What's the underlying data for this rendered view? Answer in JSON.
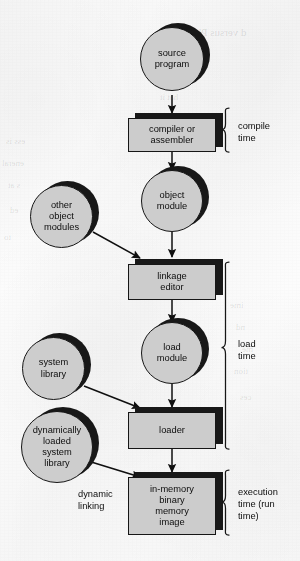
{
  "figure": {
    "ink_color": "#111111",
    "node_fill": "#c9c9c9",
    "node_shadow": "#1c1c1c",
    "paper_color": "#fbfbfb"
  },
  "nodes": {
    "source_program": {
      "line1": "source",
      "line2": "program",
      "shape": "circle"
    },
    "compiler": {
      "line1": "compiler or",
      "line2": "assembler",
      "shape": "box"
    },
    "object_module": {
      "line1": "object",
      "line2": "module",
      "shape": "circle"
    },
    "other_object_modules": {
      "line1": "other",
      "line2": "object",
      "line3": "modules",
      "shape": "circle"
    },
    "linkage_editor": {
      "line1": "linkage",
      "line2": "editor",
      "shape": "box"
    },
    "load_module": {
      "line1": "load",
      "line2": "module",
      "shape": "circle"
    },
    "system_library": {
      "line1": "system",
      "line2": "library",
      "shape": "circle"
    },
    "loader": {
      "line1": "loader",
      "shape": "box"
    },
    "dynamic_library": {
      "line1": "dynamically",
      "line2": "loaded",
      "line3": "system",
      "line4": "library",
      "shape": "circle"
    },
    "in_memory_image": {
      "line1": "in-memory",
      "line2": "binary",
      "line3": "memory",
      "line4": "image",
      "shape": "box"
    }
  },
  "labels": {
    "dynamic_linking": {
      "line1": "dynamic",
      "line2": "linking"
    }
  },
  "phases": [
    {
      "id": "compile-time",
      "line1": "compile",
      "line2": "time"
    },
    {
      "id": "load-time",
      "line1": "load",
      "line2": "time"
    },
    {
      "id": "execution-time",
      "line1": "execution",
      "line2": "time  (run",
      "line3": "time)"
    }
  ],
  "bleed_through": [
    {
      "text": "d versus Phys",
      "x": 186,
      "y": 26,
      "size": 11
    },
    {
      "text": "aces",
      "x": 152,
      "y": 47,
      "size": 10
    },
    {
      "text": "by the",
      "x": 150,
      "y": 70,
      "size": 9
    },
    {
      "text": "hat it",
      "x": 160,
      "y": 92,
      "size": 9
    },
    {
      "text": "ess is",
      "x": 6,
      "y": 136,
      "size": 9
    },
    {
      "text": "eneral",
      "x": 2,
      "y": 158,
      "size": 9
    },
    {
      "text": "s at",
      "x": 8,
      "y": 180,
      "size": 9
    },
    {
      "text": "ed",
      "x": 10,
      "y": 205,
      "size": 9
    },
    {
      "text": "to",
      "x": 4,
      "y": 232,
      "size": 9
    },
    {
      "text": "ime",
      "x": 230,
      "y": 300,
      "size": 9
    },
    {
      "text": "nd",
      "x": 236,
      "y": 322,
      "size": 9
    },
    {
      "text": "me",
      "x": 242,
      "y": 344,
      "size": 9
    },
    {
      "text": "tion",
      "x": 234,
      "y": 366,
      "size": 9
    },
    {
      "text": "ces",
      "x": 240,
      "y": 392,
      "size": 9
    }
  ]
}
